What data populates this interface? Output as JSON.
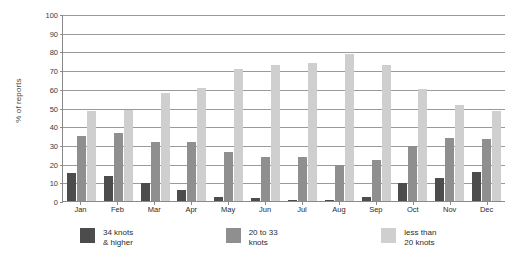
{
  "chart_data": {
    "type": "bar",
    "title": "",
    "xlabel": "",
    "ylabel": "% of reports",
    "ylim": [
      0,
      100
    ],
    "ytick_step": 10,
    "yticks": [
      100,
      90,
      80,
      70,
      60,
      50,
      40,
      30,
      20,
      10,
      0
    ],
    "grid": true,
    "legend_position": "bottom",
    "categories": [
      "Jan",
      "Feb",
      "Mar",
      "Apr",
      "May",
      "Jun",
      "Jul",
      "Aug",
      "Sep",
      "Oct",
      "Nov",
      "Dec"
    ],
    "series": [
      {
        "name": "34 knots & higher",
        "color": "#4c4c4c",
        "values": [
          15,
          13.5,
          9.5,
          6,
          2,
          1.5,
          0.7,
          0.4,
          2,
          9.5,
          12.5,
          15.5
        ]
      },
      {
        "name": "20 to 33 knots",
        "color": "#8f8f8f",
        "values": [
          35,
          36.5,
          31.5,
          31.5,
          26,
          23.5,
          23.5,
          19.5,
          22,
          29.5,
          33.5,
          33
        ]
      },
      {
        "name": "less than 20 knots",
        "color": "#cfcfcf",
        "values": [
          48,
          48.5,
          58,
          60.5,
          70.5,
          73,
          74,
          78.5,
          73,
          60,
          51.5,
          48
        ]
      }
    ]
  },
  "legend": {
    "items": [
      {
        "line1": "34 knots",
        "line2": "& higher",
        "color": "#4c4c4c"
      },
      {
        "line1": "20 to 33",
        "line2": "knots",
        "color": "#8f8f8f"
      },
      {
        "line1": "less than",
        "line2": "20 knots",
        "color": "#cfcfcf"
      }
    ]
  },
  "axis": {
    "y_title": "% of reports"
  }
}
